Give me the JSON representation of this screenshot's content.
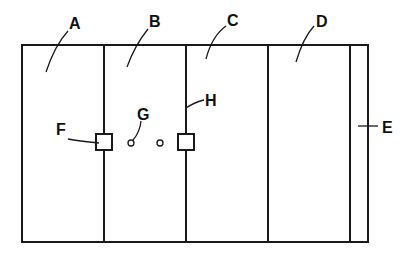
{
  "diagram": {
    "type": "patent-line-drawing",
    "panels": [
      {
        "label": "A",
        "name": "panel-a"
      },
      {
        "label": "B",
        "name": "panel-b"
      },
      {
        "label": "C",
        "name": "panel-c"
      },
      {
        "label": "D",
        "name": "panel-d"
      },
      {
        "label": "E",
        "name": "panel-e"
      }
    ],
    "components": [
      {
        "label": "F",
        "description": "square connector on divider between A and B"
      },
      {
        "label": "G",
        "description": "pair of small circles in panel B"
      },
      {
        "label": "H",
        "description": "divider line between B and C with square connector"
      }
    ],
    "labels": {
      "A": "A",
      "B": "B",
      "C": "C",
      "D": "D",
      "E": "E",
      "F": "F",
      "G": "G",
      "H": "H"
    },
    "colors": {
      "line": "#1a1a1a",
      "background": "#ffffff"
    }
  }
}
